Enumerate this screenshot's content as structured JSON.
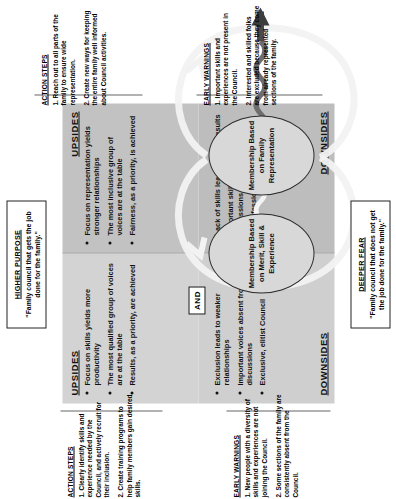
{
  "diagram": {
    "type": "polarity-map",
    "higher_purpose": {
      "title": "HIGHER PURPOSE",
      "text": "\"Family council that gets the job done for the family.\""
    },
    "deeper_fear": {
      "title": "DEEPER FEAR",
      "text": "\"Family council that does not get the job done for the family.\""
    },
    "center_connector": "AND",
    "poles": {
      "left": {
        "name": "Membership Based on Merit, Skill & Experience",
        "upsides_label": "UPSIDES",
        "upsides": [
          "Focus on skills yields more productivity",
          "The most qualified group of voices are at the table",
          "Results, as a priority, are achieved"
        ],
        "downsides_label": "DOWNSIDES",
        "downsides": [
          "Exclusion leads to weaker relationships",
          "Important voices absent from the discussions",
          "Exclusive, elitist Council"
        ]
      },
      "right": {
        "name": "Membership Based on Family Representation",
        "upsides_label": "UPSIDES",
        "upsides": [
          "Focus on representation yields stronger relationships",
          "The most inclusive group of voices are at the table",
          "Fairness, as a priority, is achieved"
        ],
        "downsides_label": "DOWNSIDES",
        "downsides": [
          "Lack of skills leads to poor results",
          "Important skills absent from the discussions",
          "Unprofessional Council"
        ]
      }
    },
    "action_steps": {
      "title": "ACTION STEPS",
      "items": [
        "1. Clearly identify skills and experience needed by the Council, and actively recruit for their inclusion.",
        "2. Create training programs to help family members gain desired skills."
      ]
    },
    "early_warnings": {
      "title": "EARLY WARNINGS",
      "items": [
        "1. New people with a diversity of skills and experiences are not joining the Council.",
        "2. Some sections of the family are consistently absent from the Council."
      ]
    },
    "action_steps_right": {
      "title": "ACTION STEPS",
      "items": [
        "1. Reach out to all parts of the family to ensure wide representation.",
        "2. Create new ways for keeping the entire family well informed about Council activities."
      ]
    },
    "early_warnings_right": {
      "title": "EARLY WARNINGS",
      "items": [
        "1. Important skills and experiences are not present in the Council.",
        "2. Interested and skilled folks are excluded because they come from already represented sections of the family."
      ]
    },
    "colors": {
      "quadrant_upper_left": "#d3d3d3",
      "quadrant_upper_right": "#c2c2c2",
      "quadrant_lower_left": "#cfcfcf",
      "quadrant_lower_right": "#bdbdbd",
      "upside_arrow": "#efefef",
      "downside_arrow": "#4a4a4a",
      "outline": "#2b2b2b"
    }
  }
}
